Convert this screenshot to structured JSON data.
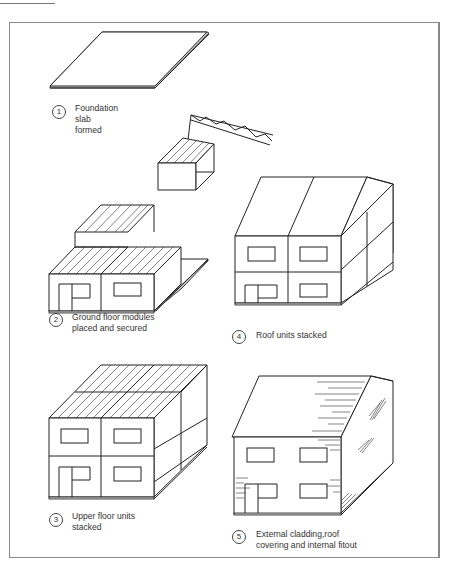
{
  "figure": {
    "steps": [
      {
        "number": "1",
        "lines": [
          "Foundation",
          "slab",
          "formed"
        ]
      },
      {
        "number": "2",
        "lines": [
          "Ground floor modules",
          "placed and secured"
        ]
      },
      {
        "number": "3",
        "lines": [
          "Upper floor units",
          "stacked"
        ]
      },
      {
        "number": "4",
        "lines": [
          "Roof units stacked"
        ]
      },
      {
        "number": "5",
        "lines": [
          "External cladding,roof",
          "covering and internal fitout"
        ]
      }
    ]
  },
  "colors": {
    "line": "#222222",
    "frame": "#8a8a8a",
    "text": "#333333",
    "background": "#ffffff"
  }
}
